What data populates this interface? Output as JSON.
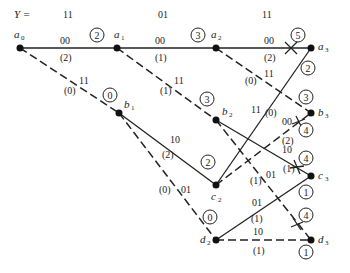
{
  "received_sequence": {
    "label": "Y =",
    "symbols": [
      "11",
      "01",
      "11"
    ]
  },
  "nodes": [
    {
      "id": "a0",
      "letter": "a",
      "sub": "0",
      "x": 20,
      "y": 48
    },
    {
      "id": "a1",
      "letter": "a",
      "sub": "1",
      "x": 117,
      "y": 48
    },
    {
      "id": "a2",
      "letter": "a",
      "sub": "2",
      "x": 216,
      "y": 48
    },
    {
      "id": "a3",
      "letter": "a",
      "sub": "3",
      "x": 311,
      "y": 48
    },
    {
      "id": "b1",
      "letter": "b",
      "sub": "1",
      "x": 119,
      "y": 113
    },
    {
      "id": "b2",
      "letter": "b",
      "sub": "2",
      "x": 216,
      "y": 120
    },
    {
      "id": "b3",
      "letter": "b",
      "sub": "3",
      "x": 311,
      "y": 113
    },
    {
      "id": "c2",
      "letter": "c",
      "sub": "2",
      "x": 216,
      "y": 185
    },
    {
      "id": "c3",
      "letter": "c",
      "sub": "3",
      "x": 311,
      "y": 176
    },
    {
      "id": "d2",
      "letter": "d",
      "sub": "2",
      "x": 216,
      "y": 240
    },
    {
      "id": "d3",
      "letter": "d",
      "sub": "3",
      "x": 311,
      "y": 240
    }
  ],
  "branches": [
    {
      "from": "a0",
      "to": "a1",
      "style": "solid",
      "output": "00",
      "distance": "(2)"
    },
    {
      "from": "a0",
      "to": "b1",
      "style": "dashed",
      "output": "11",
      "distance": "(0)"
    },
    {
      "from": "a1",
      "to": "a2",
      "style": "solid",
      "output": "00",
      "distance": "(1)"
    },
    {
      "from": "a1",
      "to": "b2",
      "style": "dashed",
      "output": "11",
      "distance": "(1)"
    },
    {
      "from": "b1",
      "to": "c2",
      "style": "solid",
      "output": "10",
      "distance": "(2)"
    },
    {
      "from": "b1",
      "to": "d2",
      "style": "dashed",
      "output": "01",
      "distance": "(0)"
    },
    {
      "from": "a2",
      "to": "a3",
      "style": "solid",
      "output": "00",
      "distance": "(2)",
      "eliminated": true
    },
    {
      "from": "a2",
      "to": "b3",
      "style": "dashed",
      "output": "11",
      "distance": "(0)"
    },
    {
      "from": "b2",
      "to": "c3",
      "style": "solid",
      "output": "10",
      "distance": "(1)",
      "eliminated": true
    },
    {
      "from": "b2",
      "to": "d3",
      "style": "dashed",
      "output": "01",
      "distance": "(1)",
      "eliminated": true
    },
    {
      "from": "c2",
      "to": "a3",
      "style": "solid",
      "output": "11",
      "distance": "(0)"
    },
    {
      "from": "c2",
      "to": "b3",
      "style": "dashed",
      "output": "00",
      "distance": "(2)",
      "eliminated": true
    },
    {
      "from": "d2",
      "to": "c3",
      "style": "solid",
      "output": "01",
      "distance": "(1)"
    },
    {
      "from": "d2",
      "to": "d3",
      "style": "dashed",
      "output": "10",
      "distance": "(1)"
    }
  ],
  "path_metrics": [
    {
      "value": "2",
      "x": 97,
      "y": 35
    },
    {
      "value": "0",
      "x": 89,
      "y": 95
    },
    {
      "value": "3",
      "x": 196,
      "y": 35
    },
    {
      "value": "3",
      "x": 202,
      "y": 95
    },
    {
      "value": "2",
      "x": 208,
      "y": 162
    },
    {
      "value": "0",
      "x": 208,
      "y": 220
    },
    {
      "value": "5",
      "x": 298,
      "y": 35
    },
    {
      "value": "2",
      "x": 309,
      "y": 68
    },
    {
      "value": "3",
      "x": 306,
      "y": 96
    },
    {
      "value": "4",
      "x": 306,
      "y": 129
    },
    {
      "value": "4",
      "x": 306,
      "y": 156
    },
    {
      "value": "1",
      "x": 306,
      "y": 193
    },
    {
      "value": "4",
      "x": 306,
      "y": 215
    },
    {
      "value": "1",
      "x": 306,
      "y": 252
    }
  ]
}
